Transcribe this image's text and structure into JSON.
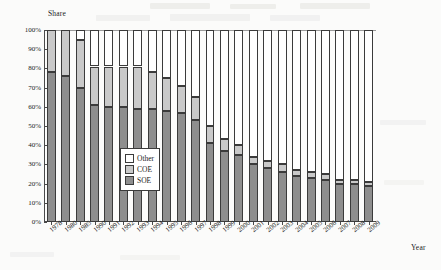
{
  "chart_data": {
    "type": "bar",
    "subtype": "stacked-100-percent-column",
    "title": "",
    "xlabel": "Year",
    "ylabel": "Share",
    "ylim": [
      0,
      100
    ],
    "yticks": [
      "0%",
      "10%",
      "20%",
      "30%",
      "40%",
      "50%",
      "60%",
      "70%",
      "80%",
      "90%",
      "100%"
    ],
    "grid": false,
    "legend_position": "inside-center-left",
    "categories": [
      "1978",
      "1980",
      "1985",
      "1990",
      "1991",
      "1992",
      "1993",
      "1994",
      "1995",
      "1996",
      "1997",
      "1998",
      "1999",
      "2000",
      "2001",
      "2002",
      "2003",
      "2004",
      "2005",
      "2006",
      "2007",
      "2008",
      "2009"
    ],
    "series": [
      {
        "name": "SOE",
        "color": "#8e8e8e",
        "values": [
          78,
          76,
          70,
          61,
          60,
          60,
          59,
          59,
          58,
          57,
          53,
          41,
          37,
          35,
          30,
          28,
          26,
          24,
          23,
          22,
          20,
          20,
          19
        ]
      },
      {
        "name": "COE",
        "color": "#c9c9c9",
        "values": [
          22,
          24,
          25,
          20,
          21,
          21,
          22,
          19,
          17,
          14,
          12,
          9,
          6,
          5,
          4,
          4,
          4,
          3,
          3,
          3,
          2,
          2,
          2
        ]
      },
      {
        "name": "Other",
        "color": "#ffffff",
        "values": [
          0,
          0,
          5,
          19,
          19,
          19,
          19,
          22,
          25,
          29,
          35,
          50,
          57,
          60,
          66,
          68,
          70,
          73,
          74,
          75,
          78,
          78,
          79
        ]
      }
    ]
  },
  "legend": {
    "items": [
      {
        "label": "Other",
        "key": "Other"
      },
      {
        "label": "COE",
        "key": "COE"
      },
      {
        "label": "SOE",
        "key": "SOE"
      }
    ]
  },
  "colors": {
    "soe": "#8e8e8e",
    "coe": "#c9c9c9",
    "other": "#ffffff",
    "axis": "#4a4a4a",
    "background": "#fbfbfa"
  }
}
